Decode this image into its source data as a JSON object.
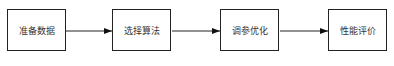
{
  "diagram": {
    "type": "flowchart",
    "direction": "left-to-right",
    "nodes": [
      {
        "id": "n1",
        "label": "准备数据"
      },
      {
        "id": "n2",
        "label": "选择算法"
      },
      {
        "id": "n3",
        "label": "调参优化"
      },
      {
        "id": "n4",
        "label": "性能评价"
      }
    ],
    "edges": [
      {
        "from": "n1",
        "to": "n2"
      },
      {
        "from": "n2",
        "to": "n3"
      },
      {
        "from": "n3",
        "to": "n4"
      }
    ],
    "colors": {
      "stroke": "#222222",
      "text": "#333333",
      "background": "#ffffff"
    }
  }
}
